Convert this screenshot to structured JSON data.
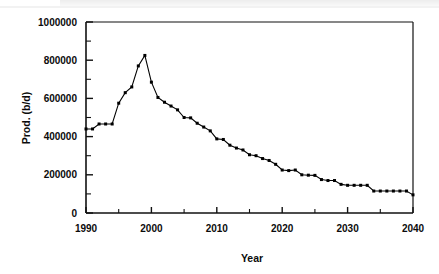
{
  "chart_data": {
    "type": "line",
    "title": "",
    "xlabel": "Year",
    "ylabel": "Prod. (b/d)",
    "xlim": [
      1990,
      2040
    ],
    "ylim": [
      0,
      1000000
    ],
    "grid": false,
    "legend": null,
    "marker": "filled-square",
    "line_color": "#000000",
    "marker_color": "#000000",
    "xticks": [
      1990,
      2000,
      2010,
      2020,
      2030,
      2040
    ],
    "xtick_labels": [
      "1990",
      "2000",
      "2010",
      "2020",
      "2030",
      "2040"
    ],
    "xminorticks": [
      1995,
      2005,
      2015,
      2025,
      2035
    ],
    "yticks": [
      0,
      200000,
      400000,
      600000,
      800000,
      1000000
    ],
    "ytick_labels": [
      "0",
      "200000",
      "400000",
      "600000",
      "800000",
      "1000000"
    ],
    "yminorticks": [
      100000,
      300000,
      500000,
      700000,
      900000
    ],
    "x": [
      1990,
      1991,
      1992,
      1993,
      1994,
      1995,
      1996,
      1997,
      1998,
      1999,
      2000,
      2001,
      2002,
      2003,
      2004,
      2005,
      2006,
      2007,
      2008,
      2009,
      2010,
      2011,
      2012,
      2013,
      2014,
      2015,
      2016,
      2017,
      2018,
      2019,
      2020,
      2021,
      2022,
      2023,
      2024,
      2025,
      2026,
      2027,
      2028,
      2029,
      2030,
      2031,
      2032,
      2033,
      2034,
      2035,
      2036,
      2037,
      2038,
      2039,
      2040
    ],
    "values": [
      440000,
      440000,
      466000,
      466000,
      466000,
      575000,
      630000,
      660000,
      770000,
      825000,
      685000,
      605000,
      580000,
      560000,
      540000,
      500000,
      498000,
      470000,
      450000,
      430000,
      388000,
      385000,
      355000,
      340000,
      330000,
      305000,
      300000,
      285000,
      275000,
      255000,
      225000,
      222000,
      225000,
      200000,
      198000,
      197000,
      175000,
      170000,
      170000,
      150000,
      145000,
      145000,
      145000,
      145000,
      115000,
      115000,
      115000,
      115000,
      115000,
      115000,
      95000
    ]
  },
  "axes": {
    "x_axis_title": "Year",
    "y_axis_title": "Prod. (b/d)"
  }
}
